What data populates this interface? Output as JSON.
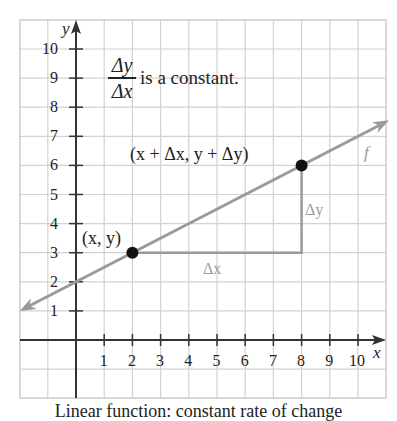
{
  "chart_data": {
    "type": "line",
    "title": "",
    "xlabel": "x",
    "ylabel": "y",
    "xlim": [
      -2,
      11
    ],
    "ylim": [
      -2,
      11
    ],
    "grid": true,
    "x_ticks": [
      1,
      2,
      3,
      4,
      5,
      6,
      7,
      8,
      9,
      10
    ],
    "y_ticks": [
      1,
      2,
      3,
      4,
      5,
      6,
      7,
      8,
      9,
      10
    ],
    "series": [
      {
        "name": "f",
        "kind": "line",
        "equation": "y = 0.5x + 2",
        "slope": 0.5,
        "intercept": 2,
        "x": [
          -2,
          11
        ],
        "y": [
          1,
          7.5
        ],
        "arrows": "both",
        "color": "#9a9a9a"
      }
    ],
    "points": [
      {
        "x": 2,
        "y": 3,
        "label": "(x, y)"
      },
      {
        "x": 8,
        "y": 6,
        "label": "(x + Δx, y + Δy)"
      }
    ],
    "annotations": [
      {
        "text": "Δx",
        "type": "horizontal-segment",
        "from": [
          2,
          3
        ],
        "to": [
          8,
          3
        ]
      },
      {
        "text": "Δy",
        "type": "vertical-segment",
        "from": [
          8,
          3
        ],
        "to": [
          8,
          6
        ]
      },
      {
        "text": "Δy/Δx is a constant.",
        "position": [
          1.2,
          9
        ]
      },
      {
        "text": "f",
        "position": [
          10.5,
          6.5
        ]
      }
    ]
  },
  "labels": {
    "y_axis": "y",
    "x_axis": "x",
    "func": "f",
    "point1": "(x, y)",
    "point2": "(x + Δx, y + Δy)",
    "dx": "Δx",
    "dy": "Δy",
    "frac_num": "Δy",
    "frac_den": "Δx",
    "frac_text": "is a constant.",
    "caption": "Linear function: constant rate of change"
  },
  "colors": {
    "grid": "#d2d2d2",
    "axis": "#333333",
    "line": "#9a9a9a",
    "point": "#111111",
    "background": "#ffffff"
  }
}
